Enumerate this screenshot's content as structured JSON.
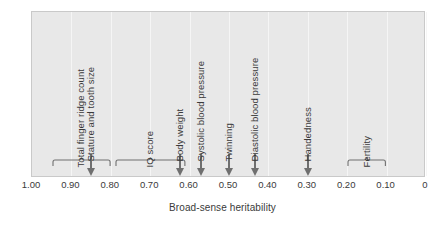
{
  "chart_data": {
    "type": "bar",
    "title": "",
    "subtitle": "",
    "xlabel": "Broad-sense heritability",
    "ylabel": "",
    "xlim": [
      1.0,
      0.0
    ],
    "x_axis_reversed": true,
    "grid": true,
    "legend": "none",
    "tick_labels": [
      "1.00",
      "0.90",
      "0.80",
      "0.70",
      "0.60",
      "0.50",
      "0.40",
      "0.30",
      "0.20",
      "0.10",
      "0"
    ],
    "tick_values": [
      1.0,
      0.9,
      0.8,
      0.7,
      0.6,
      0.5,
      0.4,
      0.3,
      0.2,
      0.1,
      0.0
    ],
    "annotations": [
      {
        "label": "Total finger ridge count",
        "marker": "bracket",
        "range": [
          0.95,
          0.8
        ],
        "value": 0.875
      },
      {
        "label": "Stature and tooth size",
        "marker": "arrow",
        "value": 0.85
      },
      {
        "label": "IQ score",
        "marker": "bracket",
        "range": [
          0.79,
          0.61
        ],
        "value": 0.7
      },
      {
        "label": "Body weight",
        "marker": "arrow",
        "value": 0.625
      },
      {
        "label": "Systolic blood pressure",
        "marker": "arrow",
        "value": 0.57
      },
      {
        "label": "Twinning",
        "marker": "arrow",
        "value": 0.5
      },
      {
        "label": "Diastolic blood pressure",
        "marker": "arrow",
        "value": 0.435
      },
      {
        "label": "Handedness",
        "marker": "arrow",
        "value": 0.3
      },
      {
        "label": "Fertility",
        "marker": "bracket",
        "range": [
          0.2,
          0.1
        ],
        "value": 0.15
      }
    ],
    "colors": {
      "panel_background": "#e8e8e8",
      "panel_border": "#c9c9c9",
      "gridline": "#f5f5f5",
      "marker": "#6f6f6f",
      "text": "#3a3a3a",
      "page_background": "#ffffff"
    }
  }
}
